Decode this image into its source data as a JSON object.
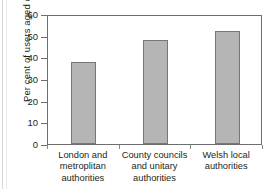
{
  "chart_data": {
    "type": "bar",
    "title": "",
    "subtitle": "",
    "xlabel": "",
    "ylabel": "Per cent of users aged over 50",
    "categories": [
      "London and metroplitan authorities",
      "County councils and unitary authorities",
      "Welsh local authorities"
    ],
    "category_lines": [
      [
        "London and",
        "metroplitan",
        "authorities"
      ],
      [
        "County councils",
        "and unitary authorities"
      ],
      [
        "Welsh local",
        "authorities"
      ]
    ],
    "values": [
      38,
      48,
      52
    ],
    "ylim": [
      0,
      60
    ],
    "ytick_values": [
      0,
      10,
      20,
      30,
      40,
      50,
      60
    ],
    "ytick_labels": [
      "0",
      "10",
      "20",
      "30",
      "40",
      "50",
      "60"
    ],
    "grid": false,
    "legend": false,
    "legend_position": "none",
    "bar_fill_color": "#b5b5b5",
    "bar_edge_color": "#767676",
    "axis_color": "#6f6f6f",
    "text_color": "#231f20",
    "background_color": "#ffffff"
  }
}
